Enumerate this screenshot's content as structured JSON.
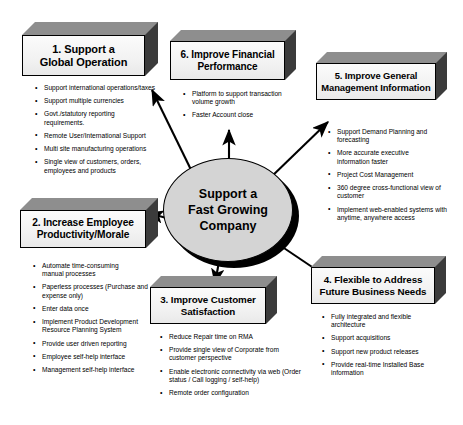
{
  "diagram": {
    "type": "hub-and-spoke",
    "center": {
      "label_lines": [
        "Support a",
        "Fast Growing",
        "Company"
      ],
      "fill_color": "#d4d4d4",
      "shadow_color": "#000000"
    },
    "box_colors": {
      "face": "#f4f4f4",
      "top": "#8e8e8e",
      "side": "#3b3b3b",
      "border": "#000000"
    },
    "arrow_color": "#000000",
    "nodes": [
      {
        "id": "node-1",
        "number": "1.",
        "title_lines": [
          "1. Support a",
          "Global Operation"
        ],
        "bullets": [
          "Support international operations/taxes",
          "Support multiple currencies",
          "Govt./statutory reporting requirements.",
          "Remote User/International  Support",
          "Multi site manufacturing operations",
          "Single view of customers, orders, employees and products"
        ]
      },
      {
        "id": "node-2",
        "number": "2.",
        "title_lines": [
          "2. Increase Employee",
          "Productivity/Morale"
        ],
        "bullets": [
          "Automate time-consuming manual processes",
          "Paperless processes (Purchase and expense only)",
          "Enter data once",
          "Implement Product Development Resource Planning System",
          "Provide user driven reporting",
          "Employee self-help interface",
          "Management self-help interface"
        ]
      },
      {
        "id": "node-3",
        "number": "3.",
        "title_lines": [
          "3. Improve Customer",
          "Satisfaction"
        ],
        "bullets": [
          "Reduce Repair time on RMA",
          "Provide single view of Corporate from customer perspective",
          "Enable electronic connectivity via web (Order status / Call logging / self-help)",
          "Remote order configuration"
        ]
      },
      {
        "id": "node-4",
        "number": "4.",
        "title_lines": [
          "4. Flexible to Address",
          "Future Business Needs"
        ],
        "bullets": [
          "Fully integrated and flexible architecture",
          "Support acquisitions",
          "Support new product releases",
          "Provide real-time Installed Base information"
        ]
      },
      {
        "id": "node-5",
        "number": "5.",
        "title_lines": [
          "5. Improve General",
          "Management  Information"
        ],
        "bullets": [
          "Support Demand Planning and forecasting",
          "More accurate executive information faster",
          "Project Cost Management",
          "360 degree cross-functional view of   customer",
          "Implement web-enabled systems with anytime, anywhere access"
        ]
      },
      {
        "id": "node-6",
        "number": "6.",
        "title_lines": [
          "6. Improve Financial",
          "Performance"
        ],
        "bullets": [
          "Platform to support transaction volume growth",
          "Faster Account close"
        ]
      }
    ]
  }
}
